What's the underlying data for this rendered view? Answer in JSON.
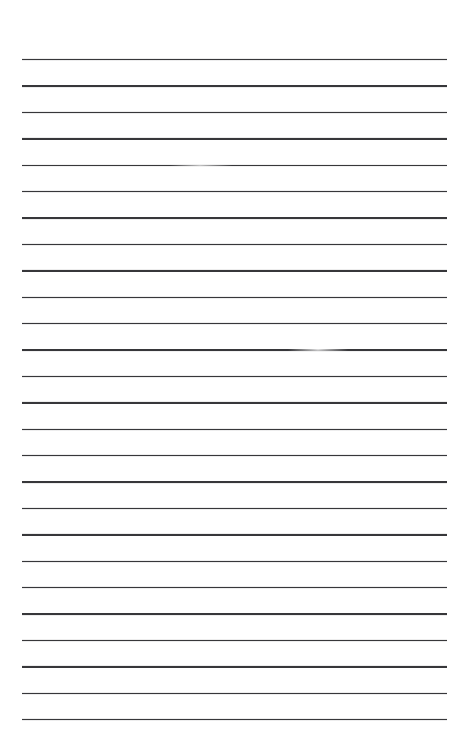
{
  "document": {
    "type": "ruled-paper-sheet",
    "title": "Blank Ruled Paper",
    "page_width": 462,
    "page_height": 756,
    "background_color": "#ffffff",
    "line_color": "#37373a",
    "line_thickness": 1.4,
    "line_count": 26,
    "line_left_x": 22,
    "line_right_x": 447,
    "line_width": 425,
    "first_line_y": 59,
    "line_spacing": 26.4,
    "top_margin": 59,
    "bottom_margin": 37,
    "written_text": "",
    "lines": [
      {
        "index": 1,
        "y": 59,
        "faded": false
      },
      {
        "index": 2,
        "y": 85.4,
        "faded": false
      },
      {
        "index": 3,
        "y": 111.8,
        "faded": false
      },
      {
        "index": 4,
        "y": 138.2,
        "faded": false
      },
      {
        "index": 5,
        "y": 164.6,
        "faded": true,
        "fade_start_x": 170,
        "fade_center_x": 200,
        "fade_end_x": 232
      },
      {
        "index": 6,
        "y": 191.0,
        "faded": false
      },
      {
        "index": 7,
        "y": 217.4,
        "faded": false
      },
      {
        "index": 8,
        "y": 243.8,
        "faded": false
      },
      {
        "index": 9,
        "y": 270.2,
        "faded": false
      },
      {
        "index": 10,
        "y": 296.6,
        "faded": false
      },
      {
        "index": 11,
        "y": 323.0,
        "faded": false
      },
      {
        "index": 12,
        "y": 349.4,
        "faded": true,
        "fade_start_x": 288,
        "fade_center_x": 318,
        "fade_end_x": 348
      },
      {
        "index": 13,
        "y": 375.8,
        "faded": false
      },
      {
        "index": 14,
        "y": 402.2,
        "faded": false
      },
      {
        "index": 15,
        "y": 428.6,
        "faded": false
      },
      {
        "index": 16,
        "y": 455.0,
        "faded": false
      },
      {
        "index": 17,
        "y": 481.4,
        "faded": false
      },
      {
        "index": 18,
        "y": 507.8,
        "faded": false
      },
      {
        "index": 19,
        "y": 534.2,
        "faded": false
      },
      {
        "index": 20,
        "y": 560.6,
        "faded": false
      },
      {
        "index": 21,
        "y": 587.0,
        "faded": false
      },
      {
        "index": 22,
        "y": 613.4,
        "faded": false
      },
      {
        "index": 23,
        "y": 639.8,
        "faded": false
      },
      {
        "index": 24,
        "y": 666.2,
        "faded": false
      },
      {
        "index": 25,
        "y": 692.6,
        "faded": false
      },
      {
        "index": 26,
        "y": 719.0,
        "faded": false
      }
    ]
  }
}
